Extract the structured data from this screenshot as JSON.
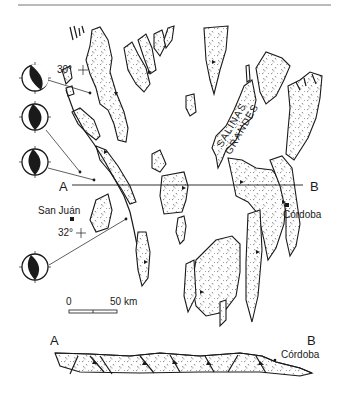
{
  "figure": {
    "type": "geologic map with cross-section",
    "colors": {
      "ink": "#1a1a1a",
      "background": "#ffffff",
      "header_rule": "#777777"
    }
  },
  "map": {
    "labels": {
      "section_start": "A",
      "section_end": "B",
      "city_west": "San Juán",
      "city_east": "Córdoba",
      "basin_line1": "SALINAS",
      "basin_line2": "GRANDES",
      "latitude_north": "30°",
      "latitude_south": "32°"
    },
    "focal_mechanisms": [
      {
        "id": 1,
        "icon": "beachball-icon"
      },
      {
        "id": 2,
        "icon": "beachball-icon"
      },
      {
        "id": 3,
        "icon": "beachball-icon"
      },
      {
        "id": 4,
        "icon": "beachball-icon"
      }
    ],
    "scale_bar": {
      "start_label": "0",
      "end_label": "50 km"
    }
  },
  "cross_section": {
    "label_left": "A",
    "label_right": "B",
    "city_label": "Córdoba"
  }
}
